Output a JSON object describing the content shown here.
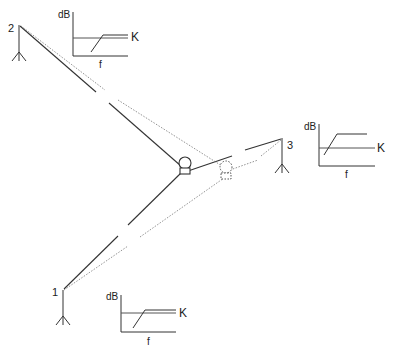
{
  "diagram": {
    "type": "sound-source-localization",
    "stations": [
      {
        "id": "1",
        "label": "1"
      },
      {
        "id": "2",
        "label": "2"
      },
      {
        "id": "3",
        "label": "3"
      }
    ],
    "sources": [
      {
        "id": "actual",
        "style": "solid"
      },
      {
        "id": "apparent",
        "style": "dashed"
      }
    ],
    "graphs": [
      {
        "station": "2",
        "y_label": "dB",
        "x_label": "f",
        "threshold_label": "K"
      },
      {
        "station": "3",
        "y_label": "dB",
        "x_label": "f",
        "threshold_label": "K"
      },
      {
        "station": "1",
        "y_label": "dB",
        "x_label": "f",
        "threshold_label": "K"
      }
    ],
    "colors": {
      "line": "#333333",
      "dotted": "#777777"
    }
  }
}
